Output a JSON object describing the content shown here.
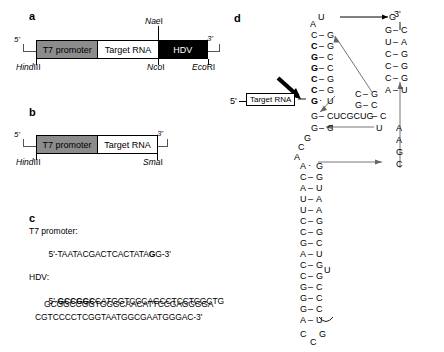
{
  "figure": {
    "panels": [
      "a",
      "b",
      "c",
      "d"
    ]
  },
  "panel_a": {
    "letter": "a",
    "five_prime": "5'",
    "three_prime": "3'",
    "segments": [
      {
        "label": "T7 promoter",
        "fill": "#8c8c8c"
      },
      {
        "label": "Target RNA",
        "fill": "#ffffff"
      },
      {
        "label": "HDV",
        "fill": "#000000"
      }
    ],
    "enzymes_top": [
      {
        "italic": "Nae",
        "plain": "I"
      }
    ],
    "enzymes_bottom": [
      {
        "italic": "Hind",
        "plain": "III"
      },
      {
        "italic": "Nco",
        "plain": "I"
      },
      {
        "italic": "Eco",
        "plain": "RI"
      }
    ]
  },
  "panel_b": {
    "letter": "b",
    "five_prime": "5'",
    "three_prime": "3'",
    "segments": [
      {
        "label": "T7 promoter",
        "fill": "#8c8c8c"
      },
      {
        "label": "Target RNA",
        "fill": "#ffffff"
      }
    ],
    "enzymes_bottom": [
      {
        "italic": "Hind",
        "plain": "III"
      },
      {
        "italic": "Sma",
        "plain": "I"
      }
    ]
  },
  "panel_c": {
    "letter": "c",
    "t7_heading": "T7 promoter:",
    "t7_seq_pre": "5'-TAATACGACTCACTATA",
    "t7_seq_bold": "G",
    "t7_seq_post": "G-3'",
    "hdv_heading": "HDV:",
    "hdv_line1_pre": "5'-",
    "hdv_line1_bold": "GCCGGC",
    "hdv_line1_post": "CATGGTCCCAGCCTCCTCGCTG",
    "hdv_line2": "GCGGCCGGTGGGCAACATTCCGAGGGGA",
    "hdv_line3": "CGTCCCCTCGGTAATGGCGAATGGGAC-3'"
  },
  "panel_d": {
    "letter": "d",
    "five_prime": "5'",
    "three_prime": "3'",
    "target_box_label": "Target RNA",
    "left_stem_pairs": [
      {
        "left": "C",
        "bond": "–",
        "right": "G",
        "bold": false
      },
      {
        "left": "C",
        "bond": "–",
        "right": "G",
        "bold": true
      },
      {
        "left": "G",
        "bond": "–",
        "right": "C",
        "bold": true
      },
      {
        "left": "G",
        "bond": "–",
        "right": "C",
        "bold": true
      },
      {
        "left": "C",
        "bond": "–",
        "right": "G",
        "bold": true
      },
      {
        "left": "C",
        "bond": "–",
        "right": "G",
        "bold": true
      },
      {
        "left": "G",
        "bond": "·",
        "right": "U",
        "bold": true
      }
    ],
    "left_loop_top": [
      "A",
      "U"
    ],
    "junction_left": "G",
    "junction_bond": "–",
    "junction_linker": "CUCGCUG",
    "junction_right": "C",
    "second_pair": {
      "left": "G",
      "bond": "–",
      "right": "C"
    },
    "left_bulge": [
      "G",
      "C",
      "A"
    ],
    "lower_stem_pairs": [
      {
        "left": "A",
        "bond": "·",
        "right": "G"
      },
      {
        "left": "C",
        "bond": "–",
        "right": "G"
      },
      {
        "left": "A",
        "bond": "–",
        "right": "U"
      },
      {
        "left": "U",
        "bond": "–",
        "right": "A"
      },
      {
        "left": "U",
        "bond": "–",
        "right": "A"
      },
      {
        "left": "C",
        "bond": "–",
        "right": "G"
      },
      {
        "left": "C",
        "bond": "–",
        "right": "G"
      },
      {
        "left": "G",
        "bond": "–",
        "right": "C"
      },
      {
        "left": "A",
        "bond": "–",
        "right": "U"
      },
      {
        "left": "C",
        "bond": "–",
        "right": "G"
      },
      {
        "left": "C",
        "bond": "–",
        "right": "G"
      },
      {
        "left": "G",
        "bond": "–",
        "right": "C"
      },
      {
        "left": "G",
        "bond": "–",
        "right": "C"
      },
      {
        "left": "G",
        "bond": "–",
        "right": "C"
      },
      {
        "left": "A",
        "bond": "–",
        "right": "U"
      },
      {
        "left": "C",
        "bond": "",
        "right": "G"
      }
    ],
    "lower_loop_bottom": "C",
    "mid_loop_u": "U",
    "right_top_nt": "G",
    "right_stem_pairs": [
      {
        "left": "G",
        "bond": "–",
        "right": "C"
      },
      {
        "left": "U",
        "bond": "–",
        "right": "A"
      },
      {
        "left": "C",
        "bond": "–",
        "right": "G"
      },
      {
        "left": "C",
        "bond": "–",
        "right": "G"
      },
      {
        "left": "C",
        "bond": "–",
        "right": "G"
      },
      {
        "left": "A",
        "bond": "–",
        "right": "U"
      }
    ],
    "right_lower_pairs": [
      {
        "left": "C",
        "bond": "–",
        "right": "G"
      },
      {
        "left": "G",
        "bond": "–",
        "right": "C"
      }
    ],
    "right_tail_u": "U",
    "right_tail_col": [
      "A",
      "A",
      "G",
      "C"
    ]
  }
}
